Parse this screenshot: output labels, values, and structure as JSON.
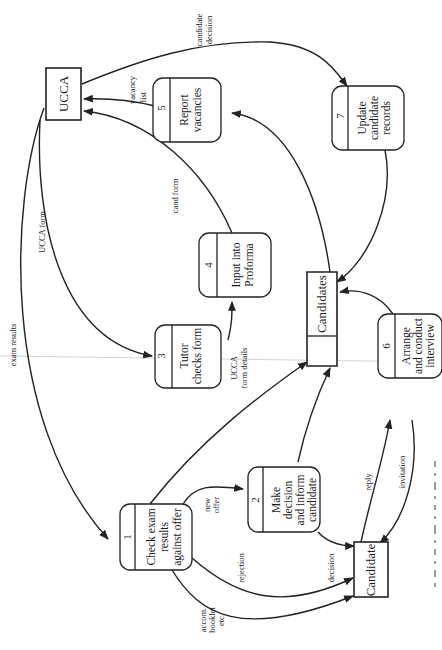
{
  "diagram": {
    "type": "data-flow-diagram",
    "orientation": "rotated 90 degrees clockwise (text reads bottom-to-top)",
    "external_entities": [
      {
        "id": "ucca",
        "label": "UCCA"
      },
      {
        "id": "candidate",
        "label": "Candidate"
      }
    ],
    "data_store": {
      "id": "candidates",
      "label": "Candidates"
    },
    "processes": [
      {
        "number": "1",
        "lines": [
          "Check exam",
          "results",
          "against offer"
        ]
      },
      {
        "number": "2",
        "lines": [
          "Make",
          "decision",
          "and inform",
          "candidate"
        ]
      },
      {
        "number": "3",
        "lines": [
          "Tutor",
          "checks form"
        ]
      },
      {
        "number": "4",
        "lines": [
          "Input into",
          "Proforma"
        ]
      },
      {
        "number": "5",
        "lines": [
          "Report",
          "vacancies"
        ]
      },
      {
        "number": "6",
        "lines": [
          "Arrange",
          "and conduct",
          "interview"
        ]
      },
      {
        "number": "7",
        "lines": [
          "Update",
          "candidate",
          "records"
        ]
      }
    ],
    "flows": [
      {
        "from": "UCCA",
        "to": "1",
        "label": "exam results"
      },
      {
        "from": "UCCA",
        "to": "3",
        "label": "UCCA form"
      },
      {
        "from": "3",
        "to": "4",
        "label_lines": [
          "UCCA",
          "form details"
        ]
      },
      {
        "from": "4",
        "to": "UCCA",
        "label": "cand form"
      },
      {
        "from": "5",
        "to": "UCCA",
        "label_lines": [
          "vacancy",
          "list"
        ]
      },
      {
        "from": "UCCA",
        "to": "7",
        "label_lines": [
          "candidate",
          "decision"
        ]
      },
      {
        "from": "1",
        "to": "2",
        "label_lines": [
          "new",
          "offer"
        ]
      },
      {
        "from": "1",
        "to": "Candidate",
        "label": "rejection"
      },
      {
        "from": "1",
        "to": "Candidate",
        "label_lines": [
          "accom.",
          "booklet",
          "etc."
        ]
      },
      {
        "from": "2",
        "to": "Candidate",
        "label": "decision"
      },
      {
        "from": "Candidate",
        "to": "6",
        "label": "reply"
      },
      {
        "from": "6",
        "to": "Candidate",
        "label": "invitation"
      },
      {
        "from": "1",
        "to": "Candidates",
        "label": ""
      },
      {
        "from": "2",
        "to": "Candidates",
        "label": ""
      },
      {
        "from": "6",
        "to": "Candidates",
        "label": ""
      },
      {
        "from": "7",
        "to": "Candidates",
        "label": ""
      },
      {
        "from": "Candidates",
        "to": "5",
        "label": ""
      }
    ]
  },
  "labels": {
    "ucca": "UCCA",
    "candidate": "Candidate",
    "candidates": "Candidates",
    "p1_num": "1",
    "p1_l1": "Check exam",
    "p1_l2": "results",
    "p1_l3": "against offer",
    "p2_num": "2",
    "p2_l1": "Make",
    "p2_l2": "decision",
    "p2_l3": "and inform",
    "p2_l4": "candidate",
    "p3_num": "3",
    "p3_l1": "Tutor",
    "p3_l2": "checks form",
    "p4_num": "4",
    "p4_l1": "Input into",
    "p4_l2": "Proforma",
    "p5_num": "5",
    "p5_l1": "Report",
    "p5_l2": "vacancies",
    "p6_num": "6",
    "p6_l1": "Arrange",
    "p6_l2": "and conduct",
    "p6_l3": "interview",
    "p7_num": "7",
    "p7_l1": "Update",
    "p7_l2": "candidate",
    "p7_l3": "records",
    "f_exam_results": "exam results",
    "f_ucca_form": "UCCA form",
    "f_ucca_form_details_1": "UCCA",
    "f_ucca_form_details_2": "form details",
    "f_cand_form": "cand form",
    "f_vacancy_1": "vacancy",
    "f_vacancy_2": "list",
    "f_cand_decision_1": "candidate",
    "f_cand_decision_2": "decision",
    "f_new_offer_1": "new",
    "f_new_offer_2": "offer",
    "f_rejection": "rejection",
    "f_accom_1": "accom.",
    "f_accom_2": "booklet",
    "f_accom_3": "etc.",
    "f_decision": "decision",
    "f_reply": "reply",
    "f_invitation": "invitation"
  }
}
